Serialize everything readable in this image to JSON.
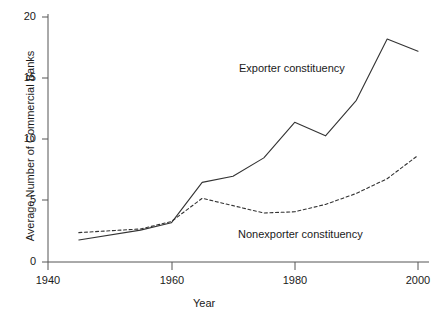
{
  "chart_data": {
    "type": "line",
    "title": "",
    "xlabel": "Year",
    "ylabel": "Average Number of Commercial Banks",
    "xlim": [
      1940,
      2001
    ],
    "ylim": [
      0,
      20
    ],
    "xticks": [
      1940,
      1960,
      1980,
      2000
    ],
    "yticks": [
      0,
      5,
      10,
      15,
      20
    ],
    "xtick_labels": [
      "1940",
      "1960",
      "1980",
      "2000"
    ],
    "ytick_labels": [
      "0",
      "5",
      "10",
      "15",
      "20"
    ],
    "grid": false,
    "legend_position": "inline-annotations",
    "series": [
      {
        "name": "Exporter constituency",
        "style": "solid",
        "color": "#333333",
        "x": [
          1945,
          1955,
          1960,
          1965,
          1970,
          1975,
          1980,
          1985,
          1990,
          1995,
          2000
        ],
        "values": [
          1.8,
          2.6,
          3.2,
          6.5,
          7.0,
          8.5,
          11.4,
          10.3,
          13.2,
          18.2,
          17.2
        ]
      },
      {
        "name": "Nonexporter constituency",
        "style": "dashed",
        "color": "#333333",
        "x": [
          1945,
          1955,
          1960,
          1965,
          1970,
          1975,
          1980,
          1985,
          1990,
          1995,
          2000
        ],
        "values": [
          2.4,
          2.7,
          3.3,
          5.2,
          4.6,
          4.0,
          4.1,
          4.7,
          5.6,
          6.8,
          8.7
        ]
      }
    ],
    "annotations": [
      {
        "text": "Exporter constituency",
        "x": 1979,
        "y": 13.8
      },
      {
        "text": "Nonexporter constituency",
        "x": 1979,
        "y": 1.6
      }
    ]
  }
}
